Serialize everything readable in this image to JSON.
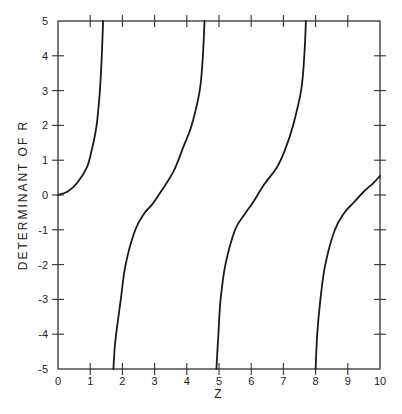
{
  "chart_data": {
    "type": "line",
    "title": "",
    "xlabel": "Z",
    "ylabel": "DETERMINANT OF R",
    "xlim": [
      0,
      10
    ],
    "ylim": [
      -5,
      5
    ],
    "grid": false,
    "legend": null,
    "x_ticks": [
      0,
      1,
      2,
      3,
      4,
      5,
      6,
      7,
      8,
      9,
      10
    ],
    "x_tick_labels": [
      "0",
      "1",
      "2",
      "3",
      "4",
      "5",
      "6",
      "7",
      "8",
      "9",
      "10"
    ],
    "y_ticks": [
      -5,
      -4,
      -3,
      -2,
      -1,
      0,
      1,
      2,
      3,
      4,
      5
    ],
    "y_tick_labels": [
      "-5",
      "-4",
      "-3",
      "-2",
      "-1",
      "0",
      "1",
      "2",
      "3",
      "4",
      "5"
    ],
    "series": [
      {
        "name": "branch 1",
        "x": [
          0,
          0.3,
          0.6,
          0.9,
          1.05,
          1.2,
          1.3,
          1.36,
          1.4
        ],
        "y": [
          0,
          0.1,
          0.35,
          0.8,
          1.3,
          2,
          3,
          4,
          5
        ]
      },
      {
        "name": "branch 2",
        "x": [
          1.72,
          1.78,
          1.95,
          2.1,
          2.4,
          2.7,
          2.9,
          3.2,
          3.6,
          3.9,
          4.15,
          4.4,
          4.5,
          4.55
        ],
        "y": [
          -5,
          -4.2,
          -3,
          -2,
          -1,
          -0.5,
          -0.3,
          0.1,
          0.7,
          1.4,
          2,
          3,
          4,
          5
        ]
      },
      {
        "name": "branch 3",
        "x": [
          4.92,
          4.98,
          5.05,
          5.2,
          5.5,
          5.8,
          6.1,
          6.4,
          6.8,
          7.05,
          7.3,
          7.55,
          7.65,
          7.7
        ],
        "y": [
          -5,
          -4,
          -3,
          -2,
          -1,
          -0.55,
          -0.15,
          0.3,
          0.8,
          1.3,
          2,
          3,
          4,
          5
        ]
      },
      {
        "name": "branch 4",
        "x": [
          8.0,
          8.05,
          8.15,
          8.3,
          8.6,
          8.9,
          9.2,
          9.5,
          9.8,
          10
        ],
        "y": [
          -5,
          -4,
          -3,
          -2,
          -1,
          -0.5,
          -0.2,
          0.1,
          0.35,
          0.55
        ]
      }
    ]
  },
  "colors": {
    "line": "#1a1a1a",
    "axis": "#333333",
    "background": "#ffffff"
  }
}
